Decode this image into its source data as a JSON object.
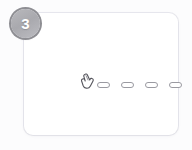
{
  "canvas": {
    "width": 192,
    "height": 150,
    "background_color": "#fcfcfd"
  },
  "card": {
    "name": "step-card",
    "background_color": "#ffffff",
    "border_color": "#e2e2e8",
    "corner_radius": "9px"
  },
  "badge": {
    "label": "3",
    "shape": "circle",
    "fill_color": "#aeaeb3",
    "ring_color": "#8e8e93",
    "text_color": "#ffffff"
  },
  "content": {
    "cursor": {
      "icon": "pointing-hand-cursor",
      "color": "#55555c"
    },
    "dashes": [
      {
        "id": "dash-1",
        "label": "",
        "shape": "pill",
        "border_color": "#9a9aa1",
        "fill_color": "#ffffff"
      },
      {
        "id": "dash-2",
        "label": "",
        "shape": "pill",
        "border_color": "#9a9aa1",
        "fill_color": "#ffffff"
      },
      {
        "id": "dash-3",
        "label": "",
        "shape": "pill",
        "border_color": "#9a9aa1",
        "fill_color": "#ffffff"
      },
      {
        "id": "dash-4",
        "label": "",
        "shape": "pill",
        "border_color": "#9a9aa1",
        "fill_color": "#ffffff"
      }
    ],
    "dash_count": 4
  }
}
